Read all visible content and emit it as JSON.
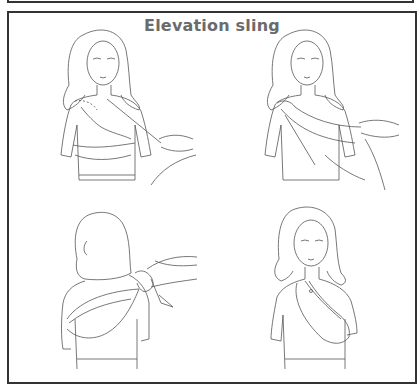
{
  "document": {
    "title": "Elevation sling",
    "title_color": "#6b6b6b",
    "border_color": "#333333"
  },
  "panels": [
    {
      "step": 1,
      "description": "Woman with injured arm across chest, helper passing triangular bandage under arm"
    },
    {
      "step": 2,
      "description": "Helper drawing bandage over forearm toward the opposite shoulder"
    },
    {
      "step": 3,
      "description": "Rear view: helper tying bandage ends at the back of the shoulder"
    },
    {
      "step": 4,
      "description": "Completed elevation sling supporting the arm across the chest"
    }
  ]
}
